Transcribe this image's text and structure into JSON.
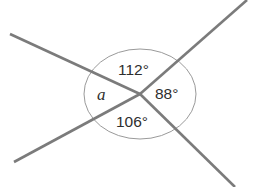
{
  "diagram": {
    "type": "angles-at-a-point",
    "vertex": {
      "x": 140,
      "y": 94
    },
    "angle_circle": {
      "cx": 140,
      "cy": 94,
      "rx": 56,
      "ry": 45
    },
    "rays": [
      {
        "name": "upper-left",
        "x2": 10,
        "y2": 34
      },
      {
        "name": "upper-right",
        "x2": 247,
        "y2": 0
      },
      {
        "name": "lower-right",
        "x2": 235,
        "y2": 187
      },
      {
        "name": "lower-left",
        "x2": 14,
        "y2": 162
      }
    ],
    "labels": {
      "top": "112°",
      "right": "88°",
      "bottom": "106°",
      "left": "a"
    },
    "colors": {
      "ray": "#7b7b7b",
      "circle": "#9a9a9a",
      "text": "#2e2e2e"
    }
  }
}
